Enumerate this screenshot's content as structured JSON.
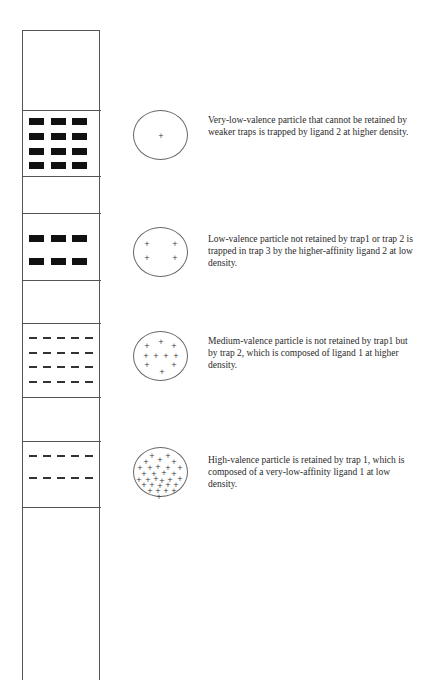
{
  "figure": {
    "column": {
      "label": "affinity column with sequential traps",
      "dividers_y": [
        110,
        176,
        213,
        280,
        323,
        397,
        441,
        507
      ]
    },
    "traps": [
      {
        "name": "trap-3",
        "style": "dense-blocks",
        "rows": 4,
        "cols": 3,
        "top": 120
      },
      {
        "name": "trap-2-blocks",
        "style": "blocks",
        "rows": 2,
        "cols": 3,
        "top": 235
      },
      {
        "name": "trap-2-dashes",
        "style": "dense-dashes",
        "rows": 4,
        "cols": 5,
        "top": 338
      },
      {
        "name": "trap-1",
        "style": "sparse-dashes",
        "rows": 2,
        "cols": 5,
        "top": 456
      }
    ],
    "particles": [
      {
        "name": "very-low-valence-particle",
        "plus_count": 1,
        "caption": "Very-low-valence particle that cannot be retained by weaker traps is trapped by ligand 2 at higher density."
      },
      {
        "name": "low-valence-particle",
        "plus_count": 4,
        "caption": "Low-valence particle not retained by trap1 or  trap 2 is trapped in trap 3 by the higher-affinity ligand 2 at low density."
      },
      {
        "name": "medium-valence-particle",
        "plus_count": 10,
        "caption": "Medium-valence particle is not retained by trap1 but by trap 2, which is composed of ligand 1 at higher density."
      },
      {
        "name": "high-valence-particle",
        "plus_count": 30,
        "caption": "High-valence particle is retained by trap 1, which is composed of a very-low-affinity ligand 1 at low density."
      }
    ]
  }
}
